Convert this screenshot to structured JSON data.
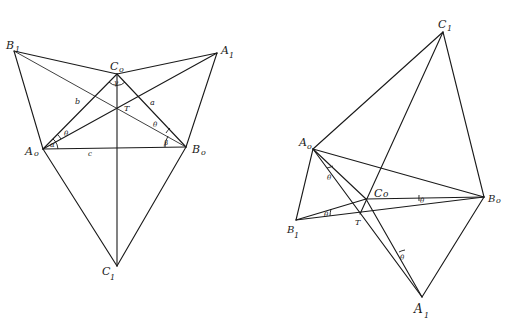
{
  "figure": {
    "background": "#ffffff",
    "stroke_color": "#1a1a1a"
  },
  "left_diagram": {
    "points": {
      "A0": {
        "label": "A",
        "sub": "o",
        "x": 43,
        "y": 149
      },
      "B0": {
        "label": "B",
        "sub": "o",
        "x": 186,
        "y": 147
      },
      "C0": {
        "label": "C",
        "sub": "o",
        "x": 117,
        "y": 74
      },
      "A1": {
        "label": "A",
        "sub": "1",
        "x": 217,
        "y": 53
      },
      "B1": {
        "label": "B",
        "sub": "1",
        "x": 14,
        "y": 51
      },
      "C1": {
        "label": "C",
        "sub": "1",
        "x": 117,
        "y": 266
      },
      "T": {
        "label": "T",
        "x": 117,
        "y": 108
      }
    },
    "side_labels": {
      "a": "a",
      "b": "b",
      "c": "c"
    },
    "angle_labels": {
      "alpha": "α",
      "beta": "β",
      "theta1": "θ",
      "theta2": "θ",
      "gamma": "γ"
    }
  },
  "right_diagram": {
    "points": {
      "A0": {
        "label": "A",
        "sub": "o",
        "x": 313,
        "y": 149
      },
      "B0": {
        "label": "B",
        "sub": "o",
        "x": 484,
        "y": 197
      },
      "C0": {
        "label": "C",
        "sub": "o",
        "x": 366,
        "y": 199
      },
      "A1": {
        "label": "A",
        "sub": "1",
        "x": 422,
        "y": 297
      },
      "B1": {
        "label": "B",
        "sub": "1",
        "x": 296,
        "y": 220
      },
      "C1": {
        "label": "C",
        "sub": "1",
        "x": 443,
        "y": 32
      },
      "T": {
        "label": "T",
        "x": 360,
        "y": 214
      }
    },
    "angle_labels": {
      "theta_a": "θ",
      "theta_b": "θ",
      "theta_c": "θ",
      "theta_d": "θ"
    }
  }
}
